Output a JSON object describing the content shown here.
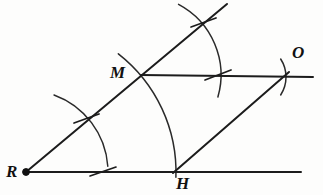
{
  "figure": {
    "type": "geometry-construction-diagram",
    "width": 323,
    "height": 195,
    "background_color": "#fdfdfc",
    "ink_color": "#1c1c1c"
  },
  "labels": {
    "R": "R",
    "M": "M",
    "H": "H",
    "O": "O"
  },
  "points": {
    "R": {
      "name": "R",
      "x": 26,
      "y": 172,
      "has_dot": true
    },
    "M": {
      "name": "M",
      "x": 141,
      "y": 75,
      "has_dot": false
    },
    "H": {
      "name": "H",
      "x": 175,
      "y": 172,
      "has_dot": false
    },
    "O": {
      "name": "O",
      "x": 285,
      "y": 76,
      "has_dot": false
    }
  },
  "segments": [
    {
      "name": "ray-R-through-M",
      "x1": 26,
      "y1": 172,
      "x2": 227,
      "y2": 4
    },
    {
      "name": "line-R-through-H",
      "x1": 26,
      "y1": 172,
      "x2": 301,
      "y2": 172
    },
    {
      "name": "line-M-through-O",
      "x1": 141,
      "y1": 75,
      "x2": 313,
      "y2": 77
    },
    {
      "name": "segment-H-to-O",
      "x1": 173,
      "y1": 173,
      "x2": 289,
      "y2": 72
    }
  ],
  "arcs": [
    {
      "name": "arc-small-at-R",
      "cx": 26,
      "cy": 172,
      "r": 82,
      "start_deg": -70,
      "end_deg": -4
    },
    {
      "name": "arc-large-at-R",
      "cx": 26,
      "cy": 172,
      "r": 150,
      "start_deg": -52,
      "end_deg": 2
    },
    {
      "name": "arc-at-M",
      "cx": 141,
      "cy": 75,
      "r": 80,
      "start_deg": -62,
      "end_deg": 16
    },
    {
      "name": "arc-small-at-O",
      "cx": 253,
      "cy": 77,
      "r": 33,
      "start_deg": -33,
      "end_deg": 33
    }
  ],
  "tick_marks": [
    {
      "name": "tick-on-ray-RM-near-R",
      "x1": 74,
      "y1": 123,
      "x2": 99,
      "y2": 114
    },
    {
      "name": "tick-on-line-RH-near-R",
      "x1": 90,
      "y1": 176,
      "x2": 116,
      "y2": 167
    },
    {
      "name": "tick-on-ray-RM-far",
      "x1": 191,
      "y1": 27,
      "x2": 216,
      "y2": 18
    },
    {
      "name": "tick-on-line-MO",
      "x1": 205,
      "y1": 80,
      "x2": 231,
      "y2": 70
    }
  ]
}
